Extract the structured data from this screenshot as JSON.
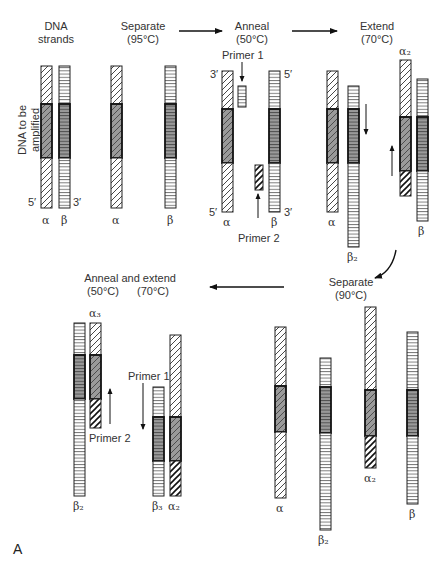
{
  "figure": {
    "panel_label": "A",
    "side_label_line1": "DNA to be",
    "side_label_line2": "amplified"
  },
  "steps": {
    "dna_strands": {
      "line1": "DNA",
      "line2": "strands"
    },
    "separate_1": {
      "line1": "Separate",
      "line2": "(95°C)"
    },
    "anneal": {
      "line1": "Anneal",
      "line2": "(50°C)"
    },
    "extend": {
      "line1": "Extend",
      "line2": "(70°C)"
    },
    "separate_2": {
      "line1": "Separate",
      "line2": "(90°C)"
    },
    "anneal_extend": {
      "line1": "Anneal and extend",
      "temp1": "(50°C)",
      "temp2": "(70°C)"
    }
  },
  "primers": {
    "primer1_top": "Primer 1",
    "primer2_top": "Primer 2",
    "primer1_bottom": "Primer 1",
    "primer2_bottom": "Primer 2"
  },
  "ends": {
    "five_prime": "5′",
    "three_prime": "3′"
  },
  "strand_labels": {
    "alpha": "α",
    "beta": "β",
    "alpha2": "α₂",
    "alpha3": "α₃",
    "beta2": "β₂",
    "beta3": "β₃"
  },
  "colors": {
    "outline": "#222222",
    "target_fill": "#9a9a9a",
    "background": "#ffffff"
  }
}
